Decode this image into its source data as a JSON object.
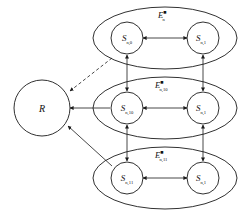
{
  "figure": {
    "background_color": "#ffffff",
    "stroke_color": "#1a1a1a",
    "width": 248,
    "height": 217
  },
  "reward_node": {
    "label": "R",
    "name": "reward-node"
  },
  "groups": [
    {
      "id": "group-top",
      "energy": {
        "base": "E",
        "superscript": "■",
        "subscript": "n"
      },
      "nodes": [
        {
          "base": "S",
          "subscript": "n,0"
        },
        {
          "base": "S",
          "subscript": "n,1"
        }
      ]
    },
    {
      "id": "group-middle",
      "energy": {
        "base": "E",
        "superscript": "■",
        "subscript": "n,10"
      },
      "nodes": [
        {
          "base": "S",
          "subscript": "n,10"
        },
        {
          "base": "S",
          "subscript": "n,1"
        }
      ]
    },
    {
      "id": "group-bottom",
      "energy": {
        "base": "E",
        "superscript": "■",
        "subscript": "n,11"
      },
      "nodes": [
        {
          "base": "S",
          "subscript": "n,11"
        },
        {
          "base": "S",
          "subscript": "n,1"
        }
      ]
    }
  ],
  "edges": {
    "dashed_to_reward": "dashed-arrow-top-to-reward",
    "solid_to_reward_middle": "arrow-middle-to-reward",
    "solid_to_reward_bottom": "arrow-bottom-to-reward"
  }
}
